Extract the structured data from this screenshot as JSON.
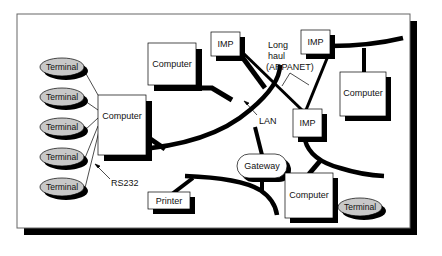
{
  "diagram": {
    "type": "network-topology",
    "nodes": {
      "terminals_left": [
        {
          "label": "Terminal"
        },
        {
          "label": "Terminal"
        },
        {
          "label": "Terminal"
        },
        {
          "label": "Terminal"
        },
        {
          "label": "Terminal"
        }
      ],
      "computer_left": {
        "label": "Computer"
      },
      "computer_top": {
        "label": "Computer"
      },
      "imp_top_left": {
        "label": "IMP"
      },
      "imp_top_right": {
        "label": "IMP"
      },
      "computer_right": {
        "label": "Computer"
      },
      "imp_middle": {
        "label": "IMP"
      },
      "gateway": {
        "label": "Gateway"
      },
      "printer": {
        "label": "Printer"
      },
      "computer_bottom": {
        "label": "Computer"
      },
      "terminal_bottom_right": {
        "label": "Terminal"
      }
    },
    "annotations": {
      "rs232": "RS232",
      "lan": "LAN",
      "long_haul_line1": "Long",
      "long_haul_line2": "haul",
      "long_haul_line3": "(ARPANET)"
    },
    "colors": {
      "terminal_fill": "#c8c8c8",
      "shadow": "#000000",
      "box_fill": "#ffffff",
      "frame_border": "#555555"
    }
  }
}
